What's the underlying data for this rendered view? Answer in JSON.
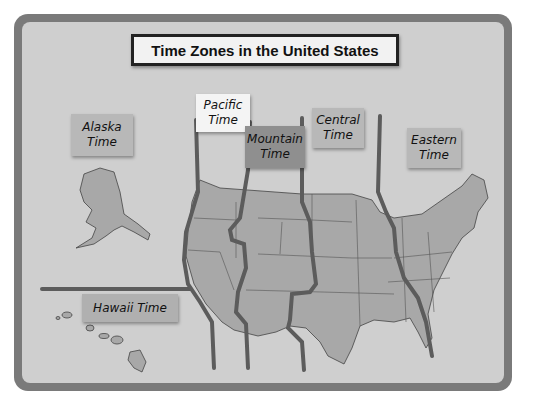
{
  "title": "Time Zones in the United States",
  "colors": {
    "frame": "#7a7a7a",
    "board": "#cfcfcf",
    "land": "#a8a8a8",
    "zone_line": "#5c5c5c",
    "pacific_label": "#f4f4f4",
    "mountain_label": "#8f8f8f",
    "other_label": "#b8b8b8"
  },
  "zones": [
    {
      "id": "alaska",
      "label": "Alaska\nTime"
    },
    {
      "id": "pacific",
      "label": "Pacific\nTime"
    },
    {
      "id": "mountain",
      "label": "Mountain\nTime"
    },
    {
      "id": "central",
      "label": "Central\nTime"
    },
    {
      "id": "eastern",
      "label": "Eastern\nTime"
    },
    {
      "id": "hawaii",
      "label": "Hawaii Time"
    }
  ]
}
